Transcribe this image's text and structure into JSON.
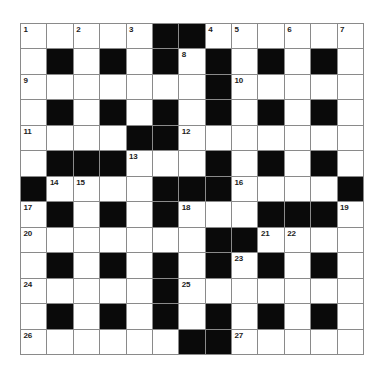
{
  "puzzle": {
    "type": "crossword",
    "rows": 13,
    "cols": 13,
    "pattern": [
      ".....##......",
      ".#.#.#.#.#.#.",
      ".......#.....",
      ".#.#.#.#.#.#.",
      "....##.......",
      ".###...#.#.#.",
      "#....###....#",
      ".#.#.#...###.",
      ".......##....",
      ".#.#.#.#.#.#.",
      ".....#.......",
      ".#.#.#.#.#.#.",
      "......##....."
    ],
    "pattern_legend": {
      "white": ".",
      "black": "#"
    },
    "numbers": [
      {
        "num": "1",
        "row": 0,
        "col": 0
      },
      {
        "num": "2",
        "row": 0,
        "col": 2
      },
      {
        "num": "3",
        "row": 0,
        "col": 4
      },
      {
        "num": "4",
        "row": 0,
        "col": 7
      },
      {
        "num": "5",
        "row": 0,
        "col": 8
      },
      {
        "num": "6",
        "row": 0,
        "col": 10
      },
      {
        "num": "7",
        "row": 0,
        "col": 12
      },
      {
        "num": "8",
        "row": 1,
        "col": 6
      },
      {
        "num": "9",
        "row": 2,
        "col": 0
      },
      {
        "num": "10",
        "row": 2,
        "col": 8
      },
      {
        "num": "11",
        "row": 4,
        "col": 0
      },
      {
        "num": "12",
        "row": 4,
        "col": 6
      },
      {
        "num": "13",
        "row": 5,
        "col": 4
      },
      {
        "num": "14",
        "row": 6,
        "col": 1
      },
      {
        "num": "15",
        "row": 6,
        "col": 2
      },
      {
        "num": "16",
        "row": 6,
        "col": 8
      },
      {
        "num": "17",
        "row": 7,
        "col": 0
      },
      {
        "num": "18",
        "row": 7,
        "col": 6
      },
      {
        "num": "19",
        "row": 7,
        "col": 12
      },
      {
        "num": "20",
        "row": 8,
        "col": 0
      },
      {
        "num": "21",
        "row": 8,
        "col": 9
      },
      {
        "num": "22",
        "row": 8,
        "col": 10
      },
      {
        "num": "23",
        "row": 9,
        "col": 8
      },
      {
        "num": "24",
        "row": 10,
        "col": 0
      },
      {
        "num": "25",
        "row": 10,
        "col": 6
      },
      {
        "num": "26",
        "row": 12,
        "col": 0
      },
      {
        "num": "27",
        "row": 12,
        "col": 8
      }
    ],
    "colors": {
      "background": "#ffffff",
      "white_cell": "#ffffff",
      "black_cell": "#0a0a0a",
      "grid_line": "#8a8a8a",
      "number_text": "#1c1c1c"
    }
  }
}
